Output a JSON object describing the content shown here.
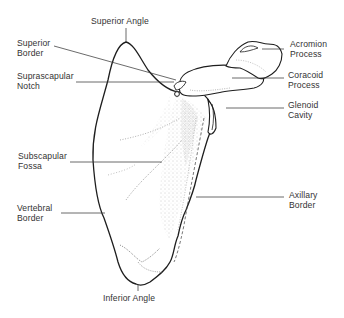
{
  "diagram": {
    "colors": {
      "outline": "#1e1e1e",
      "leader_line": "#3a3a3a",
      "stipple": "#8a8a8a",
      "label_text": "#333333",
      "background": "#ffffff"
    },
    "labels": {
      "superior_angle": "Superior Angle",
      "superior_border": "Superior\nBorder",
      "suprascapular_notch": "Suprascapular\nNotch",
      "subscapular_fossa": "Subscapular\nFossa",
      "vertebral_border": "Vertebral\nBorder",
      "inferior_angle": "Inferior Angle",
      "acromion_process": "Acromion\nProcess",
      "coracoid_process": "Coracoid\nProcess",
      "glenoid_cavity": "Glenoid\nCavity",
      "axillary_border": "Axillary\nBorder"
    }
  }
}
